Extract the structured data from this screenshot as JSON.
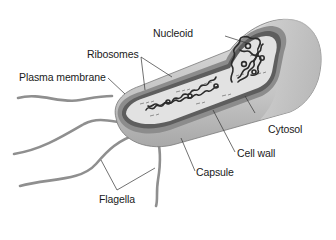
{
  "labels": {
    "nucleoid": "Nucleoid",
    "ribosomes": "Ribosomes",
    "plasma_membrane": "Plasma membrane",
    "cytosol": "Cytosol",
    "cell_wall": "Cell wall",
    "capsule": "Capsule",
    "flagella": "Flagella"
  },
  "colors": {
    "capsule_fill": "#cfcfcf",
    "capsule_shade": "#a9a9a9",
    "cell_wall": "#8a8a8a",
    "membrane": "#6e6e6e",
    "cytosol_fill": "#e4e4e4",
    "nucleoid": "#2b2b2b",
    "flagella": "#9a9a9a",
    "leader_line": "#333333",
    "text": "#1a1a1a"
  }
}
